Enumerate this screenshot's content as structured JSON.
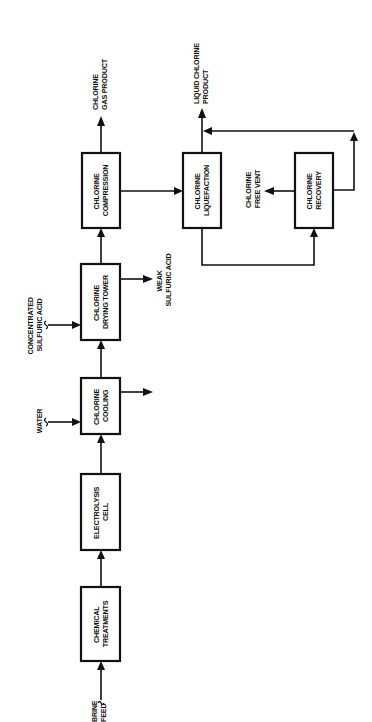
{
  "diagram": {
    "orientation": "rotated-90-ccw",
    "colors": {
      "ink": "#111111",
      "background": "#ffffff"
    },
    "inputs": {
      "brine_feed": [
        "BRINE",
        "FEED"
      ],
      "water": [
        "WATER"
      ],
      "concentrated_sulfuric_acid": [
        "CONCENTRATED",
        "SULFURIC ACID"
      ]
    },
    "units": {
      "chemical_treatments": [
        "CHEMICAL",
        "TREATMENTS"
      ],
      "electrolysis_cell": [
        "ELECTROLYSIS",
        "CELL"
      ],
      "chlorine_cooling": [
        "CHLORINE",
        "COOLING"
      ],
      "chlorine_drying_tower": [
        "CHLORINE",
        "DRYING TOWER"
      ],
      "chlorine_compression": [
        "CHLORINE",
        "COMPRESSION"
      ],
      "chlorine_liquefaction": [
        "CHLORINE",
        "LIQUEFACTION"
      ],
      "chlorine_recovery": [
        "CHLORINE",
        "RECOVERY"
      ]
    },
    "outputs": {
      "weak_sulfuric_acid": [
        "WEAK",
        "SULFURIC ACID"
      ],
      "chlorine_gas_product": [
        "CHLORINE",
        "GAS PRODUCT"
      ],
      "liquid_chlorine_product": [
        "LIQUID CHLORINE",
        "PRODUCT"
      ],
      "chlorine_free_vent": [
        "CHLORINE",
        "FREE VENT"
      ]
    },
    "flows": [
      {
        "from": "BRINE FEED",
        "to": "CHEMICAL TREATMENTS"
      },
      {
        "from": "CHEMICAL TREATMENTS",
        "to": "ELECTROLYSIS CELL"
      },
      {
        "from": "ELECTROLYSIS CELL",
        "to": "CHLORINE COOLING"
      },
      {
        "from": "WATER",
        "to": "CHLORINE COOLING"
      },
      {
        "from": "CHLORINE COOLING",
        "to": "(unlabeled outlet)"
      },
      {
        "from": "CHLORINE COOLING",
        "to": "CHLORINE DRYING TOWER"
      },
      {
        "from": "CONCENTRATED SULFURIC ACID",
        "to": "CHLORINE DRYING TOWER"
      },
      {
        "from": "CHLORINE DRYING TOWER",
        "to": "WEAK SULFURIC ACID"
      },
      {
        "from": "CHLORINE DRYING TOWER",
        "to": "CHLORINE COMPRESSION"
      },
      {
        "from": "CHLORINE COMPRESSION",
        "to": "CHLORINE GAS PRODUCT"
      },
      {
        "from": "CHLORINE COMPRESSION",
        "to": "CHLORINE LIQUEFACTION"
      },
      {
        "from": "CHLORINE LIQUEFACTION",
        "to": "LIQUID CHLORINE PRODUCT"
      },
      {
        "from": "CHLORINE LIQUEFACTION",
        "to": "CHLORINE RECOVERY"
      },
      {
        "from": "CHLORINE RECOVERY",
        "to": "CHLORINE FREE VENT"
      },
      {
        "from": "CHLORINE RECOVERY",
        "to": "LIQUID CHLORINE PRODUCT"
      }
    ]
  }
}
